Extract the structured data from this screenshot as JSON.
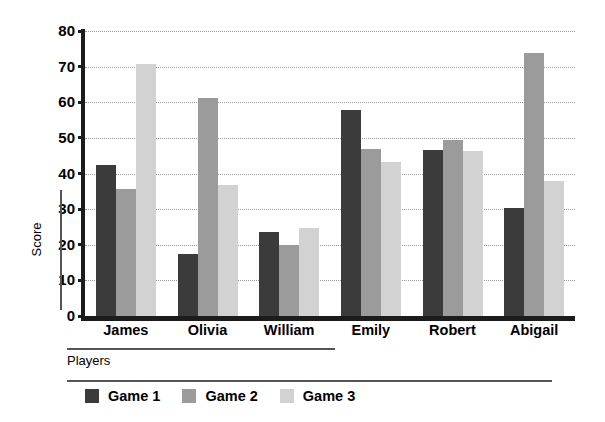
{
  "chart_data": {
    "type": "bar",
    "title": "",
    "xlabel": "Players",
    "ylabel": "Score",
    "categories": [
      "James",
      "Olivia",
      "William",
      "Emily",
      "Robert",
      "Abigail"
    ],
    "series": [
      {
        "name": "Game 1",
        "color": "#3b3b3b",
        "values": [
          42.5,
          17.5,
          23.5,
          57.8,
          46.6,
          30.3
        ]
      },
      {
        "name": "Game 2",
        "color": "#9b9b9b",
        "values": [
          35.6,
          61.3,
          19.8,
          46.9,
          49.4,
          73.8
        ]
      },
      {
        "name": "Game 3",
        "color": "#d2d2d2",
        "values": [
          70.8,
          36.8,
          24.7,
          43.2,
          46.3,
          38.0
        ]
      }
    ],
    "ylim": [
      0,
      80
    ],
    "yticks": [
      0,
      10,
      20,
      30,
      40,
      50,
      60,
      70,
      80
    ],
    "ytick_labels": [
      "0",
      "10",
      "20",
      "30",
      "40",
      "50",
      "60",
      "70",
      "80"
    ],
    "grid": true,
    "grid_style": "dotted-horizontal",
    "legend_position": "bottom-left",
    "background": "#ffffff",
    "axis_color": "#1c1c1c"
  }
}
